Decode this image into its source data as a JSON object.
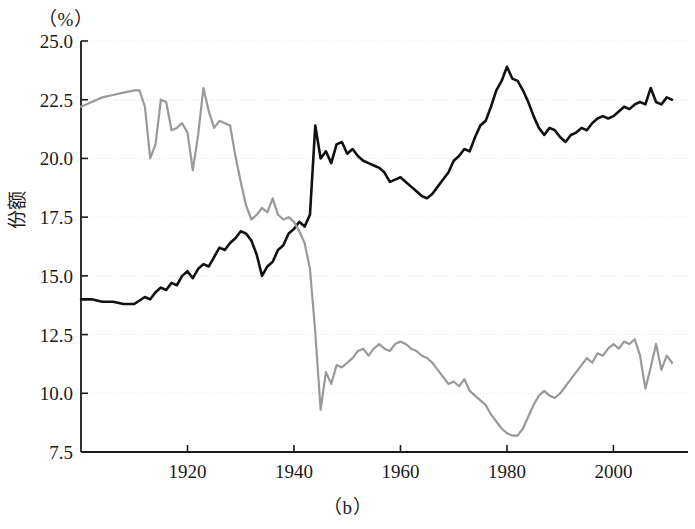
{
  "figure": {
    "caption": "（b）",
    "unit_label": "（%）",
    "y_axis_title": "份额"
  },
  "chart_data": {
    "type": "line",
    "title": "",
    "xlabel": "",
    "ylabel": "份额",
    "unit": "%",
    "xlim": [
      1900,
      2014
    ],
    "ylim": [
      7.5,
      25.0
    ],
    "xticks": [
      1920,
      1940,
      1960,
      1980,
      2000
    ],
    "yticks": [
      7.5,
      10.0,
      12.5,
      15.0,
      17.5,
      20.0,
      22.5,
      25.0
    ],
    "xtick_labels": [
      "1920",
      "1940",
      "1960",
      "1980",
      "2000"
    ],
    "ytick_labels": [
      "7.5",
      "10.0",
      "12.5",
      "15.0",
      "17.5",
      "20.0",
      "22.5",
      "25.0"
    ],
    "grid": true,
    "legend": "none",
    "series": [
      {
        "name": "black-series",
        "color": "#111111",
        "width": 2.6,
        "x": [
          1900,
          1902,
          1904,
          1906,
          1908,
          1910,
          1912,
          1913,
          1914,
          1915,
          1916,
          1917,
          1918,
          1919,
          1920,
          1921,
          1922,
          1923,
          1924,
          1925,
          1926,
          1927,
          1928,
          1929,
          1930,
          1931,
          1932,
          1933,
          1934,
          1935,
          1936,
          1937,
          1938,
          1939,
          1940,
          1941,
          1942,
          1943,
          1944,
          1945,
          1946,
          1947,
          1948,
          1949,
          1950,
          1951,
          1952,
          1953,
          1954,
          1955,
          1956,
          1957,
          1958,
          1959,
          1960,
          1961,
          1962,
          1963,
          1964,
          1965,
          1966,
          1967,
          1968,
          1969,
          1970,
          1971,
          1972,
          1973,
          1974,
          1975,
          1976,
          1977,
          1978,
          1979,
          1980,
          1981,
          1982,
          1983,
          1984,
          1985,
          1986,
          1987,
          1988,
          1989,
          1990,
          1991,
          1992,
          1993,
          1994,
          1995,
          1996,
          1997,
          1998,
          1999,
          2000,
          2001,
          2002,
          2003,
          2004,
          2005,
          2006,
          2007,
          2008,
          2009,
          2010,
          2011
        ],
        "y": [
          14.0,
          14.0,
          13.9,
          13.9,
          13.8,
          13.8,
          14.1,
          14.0,
          14.3,
          14.5,
          14.4,
          14.7,
          14.6,
          15.0,
          15.2,
          14.9,
          15.3,
          15.5,
          15.4,
          15.8,
          16.2,
          16.1,
          16.4,
          16.6,
          16.9,
          16.8,
          16.5,
          15.9,
          15.0,
          15.4,
          15.6,
          16.1,
          16.3,
          16.8,
          17.0,
          17.3,
          17.1,
          17.6,
          21.4,
          20.0,
          20.3,
          19.8,
          20.6,
          20.7,
          20.2,
          20.4,
          20.1,
          19.9,
          19.8,
          19.7,
          19.6,
          19.4,
          19.0,
          19.1,
          19.2,
          19.0,
          18.8,
          18.6,
          18.4,
          18.3,
          18.5,
          18.8,
          19.1,
          19.4,
          19.9,
          20.1,
          20.4,
          20.3,
          20.9,
          21.4,
          21.6,
          22.2,
          22.9,
          23.3,
          23.9,
          23.4,
          23.3,
          22.9,
          22.4,
          21.8,
          21.3,
          21.0,
          21.3,
          21.2,
          20.9,
          20.7,
          21.0,
          21.1,
          21.3,
          21.2,
          21.5,
          21.7,
          21.8,
          21.7,
          21.8,
          22.0,
          22.2,
          22.1,
          22.3,
          22.4,
          22.3,
          23.0,
          22.4,
          22.3,
          22.6,
          22.5
        ]
      },
      {
        "name": "gray-series",
        "color": "#999999",
        "width": 2.2,
        "x": [
          1900,
          1902,
          1904,
          1906,
          1908,
          1910,
          1911,
          1912,
          1913,
          1914,
          1915,
          1916,
          1917,
          1918,
          1919,
          1920,
          1921,
          1922,
          1923,
          1924,
          1925,
          1926,
          1927,
          1928,
          1929,
          1930,
          1931,
          1932,
          1933,
          1934,
          1935,
          1936,
          1937,
          1938,
          1939,
          1940,
          1941,
          1942,
          1943,
          1944,
          1945,
          1946,
          1947,
          1948,
          1949,
          1950,
          1951,
          1952,
          1953,
          1954,
          1955,
          1956,
          1957,
          1958,
          1959,
          1960,
          1961,
          1962,
          1963,
          1964,
          1965,
          1966,
          1967,
          1968,
          1969,
          1970,
          1971,
          1972,
          1973,
          1974,
          1975,
          1976,
          1977,
          1978,
          1979,
          1980,
          1981,
          1982,
          1983,
          1984,
          1985,
          1986,
          1987,
          1988,
          1989,
          1990,
          1991,
          1992,
          1993,
          1994,
          1995,
          1996,
          1997,
          1998,
          1999,
          2000,
          2001,
          2002,
          2003,
          2004,
          2005,
          2006,
          2007,
          2008,
          2009,
          2010,
          2011
        ],
        "y": [
          22.2,
          22.4,
          22.6,
          22.7,
          22.8,
          22.9,
          22.9,
          22.2,
          20.0,
          20.6,
          22.5,
          22.4,
          21.2,
          21.3,
          21.5,
          21.1,
          19.5,
          21.0,
          23.0,
          22.0,
          21.3,
          21.6,
          21.5,
          21.4,
          20.1,
          19.0,
          18.0,
          17.4,
          17.6,
          17.9,
          17.7,
          18.3,
          17.6,
          17.4,
          17.5,
          17.3,
          16.9,
          16.4,
          15.3,
          12.6,
          9.3,
          10.9,
          10.4,
          11.2,
          11.1,
          11.3,
          11.5,
          11.8,
          11.9,
          11.6,
          11.9,
          12.1,
          11.9,
          11.8,
          12.1,
          12.2,
          12.1,
          11.9,
          11.8,
          11.6,
          11.5,
          11.3,
          11.0,
          10.7,
          10.4,
          10.5,
          10.3,
          10.6,
          10.1,
          9.9,
          9.7,
          9.5,
          9.1,
          8.8,
          8.5,
          8.3,
          8.2,
          8.2,
          8.5,
          9.0,
          9.5,
          9.9,
          10.1,
          9.9,
          9.8,
          10.0,
          10.3,
          10.6,
          10.9,
          11.2,
          11.5,
          11.3,
          11.7,
          11.6,
          11.9,
          12.1,
          11.9,
          12.2,
          12.1,
          12.3,
          11.6,
          10.2,
          11.1,
          12.1,
          11.0,
          11.6,
          11.3
        ]
      }
    ]
  }
}
